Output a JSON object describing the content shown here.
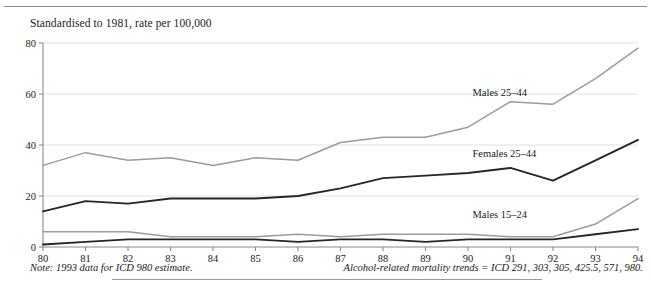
{
  "figure": {
    "axis_title": "Standardised to 1981, rate per 100,000",
    "note_left": "Note: 1993 data for ICD 980 estimate.",
    "note_right": "Alcohol-related mortality trends = ICD 291, 303, 305, 425.5, 571, 980."
  },
  "colors": {
    "gray_series": "#9b9b9b",
    "dark_series": "#262626",
    "gridline": "#d9d9d9",
    "axis": "#8a8a8a",
    "text": "#1a1a1a"
  },
  "chart_data": {
    "type": "line",
    "title": "Standardised to 1981, rate per 100,000",
    "xlabel": "",
    "ylabel": "rate per 100,000",
    "xlim": [
      80,
      94
    ],
    "ylim": [
      0,
      80
    ],
    "grid": true,
    "legend_position": "inline-labels",
    "x": [
      80,
      81,
      82,
      83,
      84,
      85,
      86,
      87,
      88,
      89,
      90,
      91,
      92,
      93,
      94
    ],
    "xtick_labels": [
      "80",
      "81",
      "82",
      "83",
      "84",
      "85",
      "86",
      "87",
      "88",
      "89",
      "90",
      "91",
      "92",
      "93",
      "94"
    ],
    "ytick_labels": [
      "0",
      "20",
      "40",
      "60",
      "80"
    ],
    "yticks": [
      0,
      20,
      40,
      60,
      80
    ],
    "series": [
      {
        "name": "Males 25–44",
        "color": "#9b9b9b",
        "label_x": 91,
        "label_y": 60,
        "values": [
          32,
          37,
          34,
          35,
          32,
          35,
          34,
          41,
          43,
          43,
          47,
          57,
          56,
          66,
          78
        ]
      },
      {
        "name": "Females 25–44",
        "color": "#262626",
        "label_x": 91,
        "label_y": 36,
        "values": [
          14,
          18,
          17,
          19,
          19,
          19,
          20,
          23,
          27,
          28,
          29,
          31,
          26,
          34,
          42
        ]
      },
      {
        "name": "Males 15–24",
        "color": "#9b9b9b",
        "label_x": 91,
        "label_y": 12,
        "values": [
          6,
          6,
          6,
          4,
          4,
          4,
          5,
          4,
          5,
          5,
          5,
          4,
          4,
          9,
          19
        ]
      },
      {
        "name": "Females 15–24",
        "color": "#262626",
        "label_x": null,
        "label_y": null,
        "values": [
          1,
          2,
          3,
          3,
          3,
          3,
          2,
          3,
          3,
          2,
          3,
          3,
          3,
          5,
          7
        ]
      }
    ],
    "annotations": [
      {
        "text": "Males 25–44"
      },
      {
        "text": "Females 25–44"
      },
      {
        "text": "Males 15–24"
      }
    ]
  }
}
